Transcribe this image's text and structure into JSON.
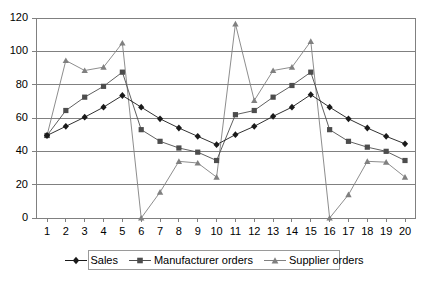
{
  "chart_data": {
    "type": "line",
    "title": "",
    "subtitle": "",
    "xlabel": "",
    "ylabel": "",
    "xlim": [
      1,
      20
    ],
    "ylim": [
      0,
      120
    ],
    "ytick_labels": [
      "0",
      "20",
      "40",
      "60",
      "80",
      "100",
      "120"
    ],
    "ytick_values": [
      0,
      20,
      40,
      60,
      80,
      100,
      120
    ],
    "xtick_labels": [
      "1",
      "2",
      "3",
      "4",
      "5",
      "6",
      "7",
      "8",
      "9",
      "10",
      "11",
      "12",
      "13",
      "14",
      "15",
      "16",
      "17",
      "18",
      "19",
      "20"
    ],
    "x": [
      1,
      2,
      3,
      4,
      5,
      6,
      7,
      8,
      9,
      10,
      11,
      12,
      13,
      14,
      15,
      16,
      17,
      18,
      19,
      20
    ],
    "grid": "horizontal",
    "legend_position": "bottom",
    "series": [
      {
        "name": "Sales",
        "marker": "diamond",
        "color": "#1a1a1a",
        "values": [
          49.5,
          55,
          60.5,
          66.5,
          73.5,
          66.5,
          59.5,
          54,
          49,
          44,
          50,
          55,
          61,
          66.5,
          74,
          66.5,
          59.5,
          54,
          49,
          44.5
        ]
      },
      {
        "name": "Manufacturer orders",
        "marker": "square",
        "color": "#4d4d4d",
        "values": [
          49.5,
          64.5,
          72.5,
          79,
          87.5,
          53,
          46,
          42,
          39.5,
          34.5,
          62,
          64.5,
          72.5,
          79.5,
          87.5,
          53,
          46,
          42.5,
          40,
          34.5
        ]
      },
      {
        "name": "Supplier orders",
        "marker": "triangle",
        "color": "#808080",
        "values": [
          49.5,
          94.5,
          88.5,
          90.5,
          105,
          0,
          15.5,
          34,
          33,
          24.5,
          116.5,
          70.5,
          88.5,
          90.5,
          106,
          0,
          14,
          34,
          33.5,
          24.5
        ]
      }
    ]
  },
  "legend": {
    "items": [
      {
        "label": "Sales"
      },
      {
        "label": "Manufacturer orders"
      },
      {
        "label": "Supplier orders"
      }
    ]
  }
}
